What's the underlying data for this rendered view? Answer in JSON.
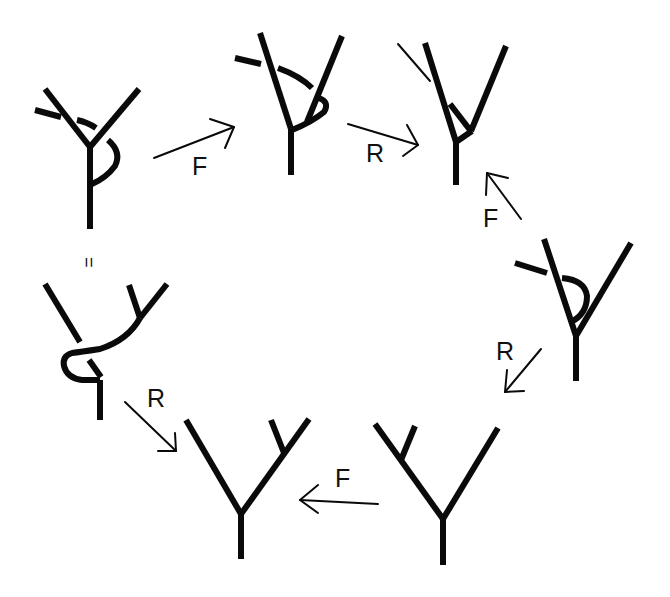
{
  "diagram": {
    "type": "move-cycle",
    "stroke_color": "#0a0a0a",
    "background": "#ffffff",
    "nodes": [
      {
        "id": "d1",
        "position": "top-left",
        "desc": "Y vertex with strand crossing over left leg and looping around stem"
      },
      {
        "id": "d2",
        "position": "top-center",
        "desc": "Y vertex with strand crossing left leg and hooking on right leg"
      },
      {
        "id": "d3",
        "position": "top-right",
        "desc": "Y vertex with short strand on left leg and small branch near junction"
      },
      {
        "id": "d4",
        "position": "right",
        "desc": "Y vertex with strand crossing left leg forming loop"
      },
      {
        "id": "d5",
        "position": "bottom-right",
        "desc": "Y vertex with extra branch on left leg"
      },
      {
        "id": "d6",
        "position": "bottom-center",
        "desc": "Y vertex with extra branch on right leg"
      },
      {
        "id": "d7",
        "position": "left",
        "desc": "Y vertex with twisted stem and branch on right leg"
      }
    ],
    "edges": [
      {
        "from": "d1",
        "to": "d2",
        "label": "F"
      },
      {
        "from": "d2",
        "to": "d3",
        "label": "R"
      },
      {
        "from": "d4",
        "to": "d3",
        "label": "F"
      },
      {
        "from": "d4",
        "to": "d5",
        "label": "R"
      },
      {
        "from": "d5",
        "to": "d6",
        "label": "F"
      },
      {
        "from": "d7",
        "to": "d6",
        "label": "R"
      },
      {
        "from": "d1",
        "to": "d7",
        "label": "="
      }
    ]
  },
  "labels": {
    "f1": "F",
    "r1": "R",
    "f2": "F",
    "r2": "R",
    "f3": "F",
    "r3": "R",
    "equals": "="
  }
}
